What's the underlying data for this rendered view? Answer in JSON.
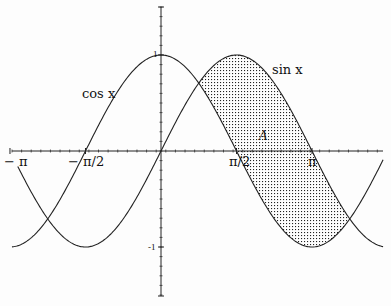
{
  "figure": {
    "curves": [
      {
        "name": "cos x",
        "label": "cos x",
        "fn": "cos"
      },
      {
        "name": "sin x",
        "label": "sin x",
        "fn": "sin"
      }
    ],
    "region_label": "A",
    "shaded_region": {
      "from": "π/4",
      "to": "5π/4",
      "between": [
        "sin x",
        "cos x"
      ],
      "fill": "dotted"
    },
    "x_ticks": [
      {
        "label": "− π",
        "value": -3.14159
      },
      {
        "label": "− π/2",
        "value": -1.5708
      },
      {
        "label": "π/2",
        "value": 1.5708
      },
      {
        "label": "π",
        "value": 3.14159
      }
    ],
    "y_ticks": [
      {
        "label": "1",
        "value": 1
      },
      {
        "label": "-1",
        "value": -1
      }
    ],
    "x_range": [
      -3.14159,
      4.6
    ],
    "y_range": [
      -1.5,
      1.5
    ]
  },
  "labels": {
    "cos": "cos x",
    "sin": "sin x",
    "A": "A",
    "neg_pi": "− π",
    "neg_pi_2": "− π/2",
    "pi_2": "π/2",
    "pi": "π",
    "one": "1",
    "neg_one": "-1"
  }
}
